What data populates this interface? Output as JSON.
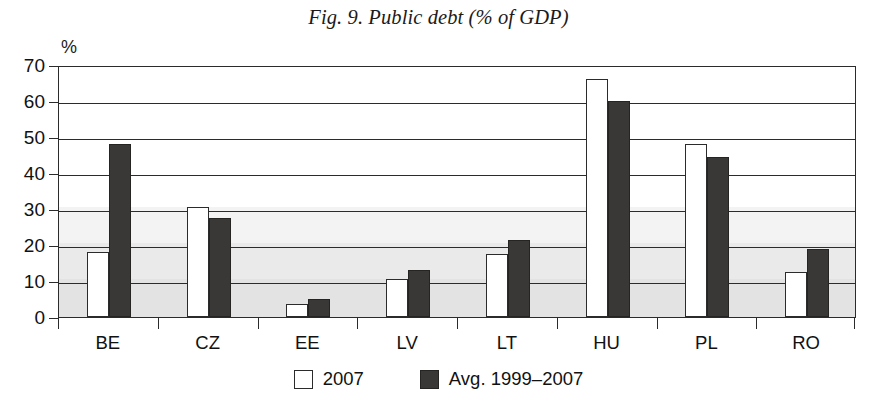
{
  "chart_data": {
    "type": "bar",
    "title": "Fig. 9. Public debt (% of GDP)",
    "xlabel": "",
    "ylabel": "%",
    "ylim": [
      0,
      70
    ],
    "ytick_step": 10,
    "yticks": [
      "0",
      "10",
      "20",
      "30",
      "40",
      "50",
      "60",
      "70"
    ],
    "grid": true,
    "grid_axis": "y",
    "legend_position": "bottom",
    "categories": [
      "BE",
      "CZ",
      "EE",
      "LV",
      "LT",
      "HU",
      "PL",
      "RO"
    ],
    "series": [
      {
        "name": "2007",
        "color": "#ffffff",
        "values": [
          18.0,
          30.5,
          3.5,
          10.5,
          17.5,
          66.0,
          48.0,
          12.5
        ]
      },
      {
        "name": "Avg. 1999–2007",
        "color": "#3a3836",
        "values": [
          48.0,
          27.5,
          5.0,
          13.0,
          21.5,
          60.0,
          44.5,
          19.0
        ]
      }
    ]
  },
  "legend": {
    "items": [
      {
        "label": "2007"
      },
      {
        "label": "Avg. 1999–2007"
      }
    ]
  },
  "colors": {
    "series_a": "#ffffff",
    "series_b": "#3a3836",
    "axis": "#2b2b2b",
    "background": "#ffffff"
  }
}
